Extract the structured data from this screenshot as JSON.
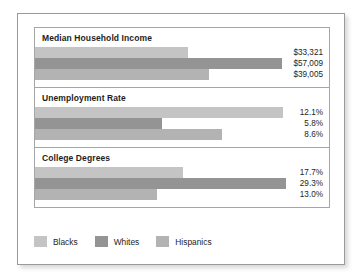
{
  "chart_data": {
    "type": "bar",
    "title": "",
    "orientation": "horizontal",
    "grid": false,
    "legend_position": "bottom-left",
    "categories": [
      "Blacks",
      "Whites",
      "Hispanics"
    ],
    "panels": [
      {
        "title": "Median Household Income",
        "unit": "USD",
        "values": [
          33321,
          57009,
          39005
        ],
        "labels": [
          "$33,321",
          "$57,009",
          "$39,005"
        ],
        "bar_lengths_px": [
          153,
          247,
          174
        ],
        "axis_max": 60000
      },
      {
        "title": "Unemployment Rate",
        "unit": "percent",
        "values": [
          12.1,
          5.8,
          8.6
        ],
        "labels": [
          "12.1%",
          "5.8%",
          "8.6%"
        ],
        "bar_lengths_px": [
          248,
          127,
          187
        ],
        "axis_max": 13
      },
      {
        "title": "College Degrees",
        "unit": "percent",
        "values": [
          17.7,
          29.3,
          13.0
        ],
        "labels": [
          "17.7%",
          "29.3%",
          "13.0%"
        ],
        "bar_lengths_px": [
          148,
          251,
          122
        ],
        "axis_max": 30
      }
    ],
    "series_colors": [
      "#c4c4c4",
      "#949494",
      "#b3b3b3"
    ]
  },
  "legend": {
    "items": [
      {
        "label": "Blacks",
        "color": "#c4c4c4"
      },
      {
        "label": "Whites",
        "color": "#949494"
      },
      {
        "label": "Hispanics",
        "color": "#b3b3b3"
      }
    ]
  }
}
